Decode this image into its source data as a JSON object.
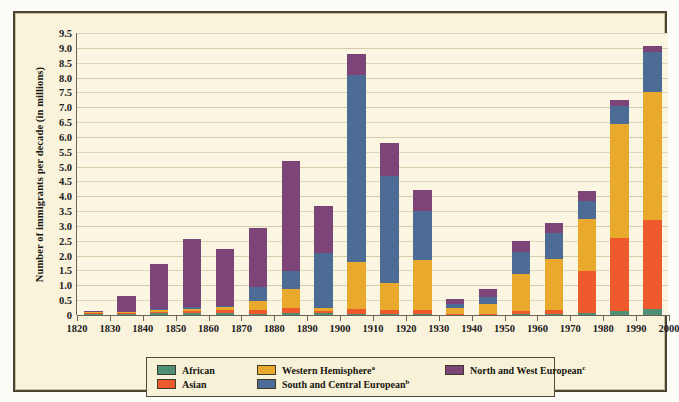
{
  "chart_data": {
    "type": "bar",
    "subtype": "stacked",
    "title": "",
    "xlabel": "",
    "ylabel": "Number of immigrants per decade (in millions)",
    "ylim": [
      0,
      9.5
    ],
    "ytick_step": 0.5,
    "yticks": [
      "0",
      "0.5",
      "1.0",
      "1.5",
      "2.0",
      "2.5",
      "3.0",
      "3.5",
      "4.0",
      "4.5",
      "5.0",
      "5.5",
      "6.0",
      "6.5",
      "7.0",
      "7.5",
      "8.0",
      "8.5",
      "9.0",
      "9.5"
    ],
    "xticks": [
      "1820",
      "1830",
      "1840",
      "1850",
      "1860",
      "1870",
      "1880",
      "1890",
      "1900",
      "1910",
      "1920",
      "1930",
      "1940",
      "1950",
      "1960",
      "1970",
      "1980",
      "1990",
      "2000"
    ],
    "xlim": [
      1820,
      2000
    ],
    "grid": true,
    "legend_position": "bottom",
    "categories": [
      "1820s",
      "1830s",
      "1840s",
      "1850s",
      "1860s",
      "1870s",
      "1880s",
      "1890s",
      "1900s",
      "1910s",
      "1920s",
      "1930s",
      "1940s",
      "1950s",
      "1960s",
      "1970s",
      "1980s",
      "1990s"
    ],
    "category_starts": [
      1820,
      1830,
      1840,
      1850,
      1860,
      1870,
      1880,
      1890,
      1900,
      1910,
      1920,
      1930,
      1940,
      1950,
      1960,
      1970,
      1980,
      1990
    ],
    "series": [
      {
        "name": "African",
        "color": "#4e8f76",
        "values": [
          0.04,
          0.05,
          0.07,
          0.08,
          0.06,
          0.05,
          0.06,
          0.06,
          0.05,
          0.04,
          0.04,
          0.01,
          0.01,
          0.02,
          0.03,
          0.08,
          0.14,
          0.2
        ]
      },
      {
        "name": "Asian",
        "color": "#ee5a2c",
        "values": [
          0.02,
          0.02,
          0.03,
          0.06,
          0.1,
          0.12,
          0.19,
          0.08,
          0.15,
          0.14,
          0.13,
          0.02,
          0.04,
          0.12,
          0.15,
          1.4,
          2.45,
          3.0
        ]
      },
      {
        "name": "Western Hemisphere",
        "color": "#e8a92c",
        "values": [
          0.03,
          0.03,
          0.07,
          0.06,
          0.1,
          0.29,
          0.64,
          0.1,
          1.6,
          0.9,
          1.7,
          0.2,
          0.33,
          1.25,
          1.7,
          1.75,
          3.85,
          4.3
        ]
      },
      {
        "name": "South and Central European",
        "color": "#4c6b95",
        "values": [
          0.01,
          0.01,
          0.02,
          0.08,
          0.05,
          0.5,
          0.6,
          1.85,
          6.3,
          3.6,
          1.65,
          0.15,
          0.22,
          0.75,
          0.9,
          0.6,
          0.6,
          1.35
        ]
      },
      {
        "name": "North and West European",
        "color": "#7d4478",
        "values": [
          0.03,
          0.52,
          1.53,
          2.27,
          1.9,
          1.96,
          3.71,
          1.6,
          0.7,
          1.12,
          0.68,
          0.15,
          0.26,
          0.36,
          0.32,
          0.35,
          0.21,
          0.2
        ]
      }
    ]
  },
  "legend": {
    "items": [
      {
        "label": "African",
        "sup": "",
        "color": "#4e8f76",
        "row": 0,
        "col": 0
      },
      {
        "label": "Western Hemisphere",
        "sup": "a",
        "color": "#e8a92c",
        "row": 0,
        "col": 1
      },
      {
        "label": "North and West European",
        "sup": "c",
        "color": "#7d4478",
        "row": 0,
        "col": 2
      },
      {
        "label": "Asian",
        "sup": "",
        "color": "#ee5a2c",
        "row": 1,
        "col": 0
      },
      {
        "label": "South and Central European",
        "sup": "b",
        "color": "#4c6b95",
        "row": 1,
        "col": 1
      }
    ]
  },
  "colors": {
    "background": "#f9f3db",
    "plot_background": "#fbf6e2",
    "frame": "#4a4336",
    "gridline": "#ddd6b8",
    "axis": "#6b6454",
    "text": "#20201c"
  }
}
